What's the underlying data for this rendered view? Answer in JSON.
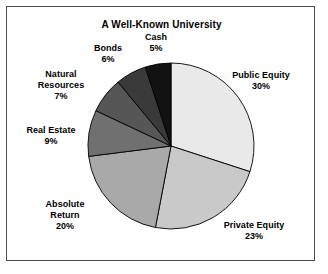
{
  "figure": {
    "title": "A Well-Known University",
    "background_color": "#ffffff",
    "frame_color": "#4a4a4a",
    "text_color": "#000000"
  },
  "chart_data": {
    "type": "pie",
    "title": "A Well-Known University",
    "xlabel": "",
    "ylabel": "",
    "start_angle_deg": 0,
    "direction": "clockwise",
    "total": 100,
    "units": "percent",
    "grid": false,
    "legend": "none",
    "labels_position": "outside",
    "categories": [
      "Public Equity",
      "Private Equity",
      "Absolute Return",
      "Real Estate",
      "Natural Resources",
      "Bonds",
      "Cash"
    ],
    "values": [
      30,
      23,
      20,
      9,
      7,
      6,
      5
    ],
    "colors": [
      "#e9e9e9",
      "#c9c9c9",
      "#a9a9a9",
      "#707070",
      "#565656",
      "#3a3a3a",
      "#121212"
    ],
    "slices": [
      {
        "label": "Public Equity",
        "value": 30,
        "value_text": "30%",
        "color": "#e9e9e9",
        "label_left": 213,
        "label_top": 63,
        "label_width": 82
      },
      {
        "label": "Private Equity",
        "value": 23,
        "value_text": "23%",
        "color": "#c9c9c9",
        "label_left": 203,
        "label_top": 213,
        "label_width": 88
      },
      {
        "label": "Absolute\nReturn",
        "value": 20,
        "value_text": "20%",
        "color": "#a9a9a9",
        "label_left": 22,
        "label_top": 192,
        "label_width": 72
      },
      {
        "label": "Real Estate",
        "value": 9,
        "value_text": "9%",
        "color": "#707070",
        "label_left": 6,
        "label_top": 118,
        "label_width": 76
      },
      {
        "label": "Natural\nResources",
        "value": 7,
        "value_text": "7%",
        "color": "#565656",
        "label_left": 18,
        "label_top": 62,
        "label_width": 72
      },
      {
        "label": "Bonds",
        "value": 6,
        "value_text": "6%",
        "color": "#3a3a3a",
        "label_left": 78,
        "label_top": 36,
        "label_width": 46
      },
      {
        "label": "Cash",
        "value": 5,
        "value_text": "5%",
        "color": "#121212",
        "label_left": 128,
        "label_top": 25,
        "label_width": 42
      }
    ],
    "geometry": {
      "center_x": 164,
      "center_y": 139,
      "radius": 83
    }
  }
}
